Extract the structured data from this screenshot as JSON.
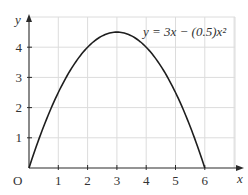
{
  "chart_data": {
    "type": "line",
    "title": "",
    "equation_label": "y = 3x − (0.5)x²",
    "xlabel": "x",
    "ylabel": "y",
    "origin_label": "O",
    "xlim": [
      0,
      7
    ],
    "ylim": [
      0,
      5
    ],
    "x_ticks": [
      "1",
      "2",
      "3",
      "4",
      "5",
      "6"
    ],
    "y_ticks": [
      "1",
      "2",
      "3",
      "4"
    ],
    "grid": true,
    "legend": "none",
    "series": [
      {
        "name": "y = 3x − (0.5)x²",
        "x": [
          0,
          0.5,
          1,
          1.5,
          2,
          2.5,
          3,
          3.5,
          4,
          4.5,
          5,
          5.5,
          6
        ],
        "y": [
          0,
          1.375,
          2.5,
          3.375,
          4,
          4.375,
          4.5,
          4.375,
          4,
          3.375,
          2.5,
          1.375,
          0
        ]
      }
    ]
  }
}
